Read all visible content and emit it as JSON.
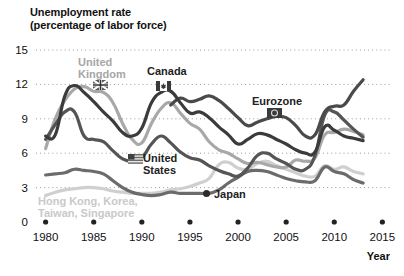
{
  "chart_data": {
    "type": "line",
    "title": "Unemployment rate",
    "subtitle": "(percentage of labor force)",
    "xlabel": "Year",
    "ylabel": "",
    "xlim": [
      1979,
      2016
    ],
    "ylim": [
      0,
      15
    ],
    "yticks": [
      "0",
      "3",
      "6",
      "9",
      "12",
      "15"
    ],
    "ytick_values": [
      0,
      3,
      6,
      9,
      12,
      15
    ],
    "xticks": [
      "1980",
      "1985",
      "1990",
      "1995",
      "2000",
      "2005",
      "2010",
      "2015"
    ],
    "xtick_values": [
      1980,
      1985,
      1990,
      1995,
      2000,
      2005,
      2010,
      2015
    ],
    "grid": "horizontal-dotted",
    "legend": "inline-labels",
    "series": [
      {
        "name": "United Kingdom",
        "color": "#a8a8a8",
        "marker": "uk-flag-icon",
        "x": [
          1980,
          1981,
          1982,
          1983,
          1984,
          1985,
          1986,
          1987,
          1988,
          1989,
          1990,
          1991,
          1992,
          1993,
          1994,
          1995,
          1996,
          1997,
          1998,
          1999,
          2000,
          2001,
          2002,
          2003,
          2004,
          2005,
          2006,
          2007,
          2008,
          2009,
          2010,
          2011,
          2012,
          2013
        ],
        "values": [
          6.4,
          9.0,
          10.6,
          11.6,
          11.8,
          11.4,
          11.3,
          10.4,
          8.6,
          7.2,
          6.9,
          8.6,
          9.9,
          10.4,
          9.5,
          8.6,
          8.1,
          7.0,
          6.3,
          6.0,
          5.5,
          5.1,
          5.2,
          5.0,
          4.8,
          4.8,
          5.4,
          5.3,
          5.6,
          7.6,
          7.8,
          8.1,
          7.9,
          7.6
        ]
      },
      {
        "name": "Canada",
        "color": "#3b3b3b",
        "marker": "canada-flag-icon",
        "x": [
          1980,
          1981,
          1982,
          1983,
          1984,
          1985,
          1986,
          1987,
          1988,
          1989,
          1990,
          1991,
          1992,
          1993,
          1994,
          1995,
          1996,
          1997,
          1998,
          1999,
          2000,
          2001,
          2002,
          2003,
          2004,
          2005,
          2006,
          2007,
          2008,
          2009,
          2010,
          2011,
          2012,
          2013
        ],
        "values": [
          7.5,
          7.6,
          11.0,
          11.9,
          11.3,
          10.5,
          9.6,
          8.8,
          7.8,
          7.5,
          8.2,
          10.4,
          11.3,
          11.4,
          10.4,
          9.5,
          9.6,
          9.1,
          8.3,
          7.6,
          6.8,
          7.2,
          7.7,
          7.6,
          7.2,
          6.8,
          6.3,
          6.0,
          6.1,
          8.3,
          8.0,
          7.5,
          7.3,
          7.1
        ]
      },
      {
        "name": "Eurozone",
        "color": "#4a4a4a",
        "marker": "eu-flag-icon",
        "x": [
          1993,
          1994,
          1995,
          1996,
          1997,
          1998,
          1999,
          2000,
          2001,
          2002,
          2003,
          2004,
          2005,
          2006,
          2007,
          2008,
          2009,
          2010,
          2011,
          2012,
          2013
        ],
        "values": [
          10.2,
          10.8,
          10.5,
          10.7,
          11.0,
          10.6,
          9.9,
          9.1,
          8.4,
          8.7,
          9.0,
          9.2,
          9.1,
          8.4,
          7.5,
          7.6,
          9.6,
          10.1,
          10.2,
          11.4,
          12.4
        ]
      },
      {
        "name": "United States",
        "color": "#555555",
        "marker": "us-flag-icon",
        "x": [
          1980,
          1981,
          1982,
          1983,
          1984,
          1985,
          1986,
          1987,
          1988,
          1989,
          1990,
          1991,
          1992,
          1993,
          1994,
          1995,
          1996,
          1997,
          1998,
          1999,
          2000,
          2001,
          2002,
          2003,
          2004,
          2005,
          2006,
          2007,
          2008,
          2009,
          2010,
          2011,
          2012,
          2013
        ],
        "values": [
          7.2,
          8.5,
          9.6,
          9.6,
          7.5,
          7.2,
          7.0,
          6.2,
          5.5,
          5.3,
          5.6,
          6.8,
          7.5,
          6.9,
          6.1,
          5.6,
          5.4,
          4.9,
          4.5,
          4.2,
          4.0,
          4.7,
          5.8,
          6.0,
          5.5,
          5.1,
          4.6,
          4.6,
          5.8,
          9.3,
          9.6,
          8.9,
          8.1,
          7.4
        ]
      },
      {
        "name": "Japan",
        "color": "#6b6b6b",
        "marker": "japan-dot-icon",
        "x": [
          1980,
          1981,
          1982,
          1983,
          1984,
          1985,
          1986,
          1987,
          1988,
          1989,
          1990,
          1991,
          1992,
          1993,
          1994,
          1995,
          1996,
          1997,
          1998,
          1999,
          2000,
          2001,
          2002,
          2003,
          2004,
          2005,
          2006,
          2007,
          2008,
          2009,
          2010,
          2011,
          2012,
          2013
        ],
        "values": [
          4.1,
          4.2,
          4.3,
          4.6,
          4.5,
          4.4,
          4.2,
          3.6,
          3.0,
          2.6,
          2.4,
          2.3,
          2.4,
          2.6,
          2.5,
          2.5,
          2.5,
          2.5,
          2.8,
          3.4,
          3.9,
          4.4,
          4.5,
          4.4,
          4.1,
          3.8,
          3.6,
          3.5,
          3.6,
          4.8,
          4.4,
          4.2,
          3.7,
          3.4
        ]
      },
      {
        "name": "Hong Kong, Korea, Taiwan, Singapore",
        "color": "#cfcfcf",
        "marker": "none",
        "x": [
          1980,
          1981,
          1982,
          1983,
          1984,
          1985,
          1986,
          1987,
          1988,
          1989,
          1990,
          1991,
          1992,
          1993,
          1994,
          1995,
          1996,
          1997,
          1998,
          1999,
          2000,
          2001,
          2002,
          2003,
          2004,
          2005,
          2006,
          2007,
          2008,
          2009,
          2010,
          2011,
          2012,
          2013
        ],
        "values": [
          2.3,
          2.6,
          2.8,
          2.9,
          3.0,
          3.0,
          2.9,
          2.7,
          2.6,
          2.5,
          2.5,
          2.5,
          2.6,
          2.8,
          2.9,
          3.1,
          3.4,
          3.8,
          5.0,
          5.2,
          4.7,
          4.6,
          5.1,
          5.3,
          4.9,
          4.6,
          4.3,
          4.0,
          4.0,
          4.9,
          4.6,
          4.8,
          4.4,
          4.2
        ]
      }
    ],
    "annotations": [
      {
        "label": "United Kingdom",
        "at_x": 1985,
        "at_y": 11.6
      },
      {
        "label": "Canada",
        "at_x": 1992,
        "at_y": 11.3
      },
      {
        "label": "Eurozone",
        "at_x": 2005,
        "at_y": 9.1
      },
      {
        "label": "United States",
        "at_x": 1989,
        "at_y": 5.5
      },
      {
        "label": "Japan",
        "at_x": 1996,
        "at_y": 2.5
      },
      {
        "label": "Hong Kong, Korea, Taiwan, Singapore",
        "at_x": 1982,
        "at_y": 1.3
      }
    ]
  },
  "labels": {
    "title_line1": "Unemployment rate",
    "title_line2": "(percentage of labor force)",
    "axis_year": "Year",
    "uk": "United Kingdom",
    "uk_line1": "United",
    "uk_line2": "Kingdom",
    "canada": "Canada",
    "eurozone": "Eurozone",
    "us_line1": "United",
    "us_line2": "States",
    "japan": "Japan",
    "tigers_line1": "Hong Kong, Korea,",
    "tigers_line2": "Taiwan, Singapore"
  },
  "colors": {
    "uk": "#a8a8a8",
    "canada": "#3b3b3b",
    "eurozone": "#4a4a4a",
    "us": "#555555",
    "japan": "#6b6b6b",
    "tigers": "#cfcfcf",
    "grid": "#9a9a9a",
    "text": "#111111"
  }
}
